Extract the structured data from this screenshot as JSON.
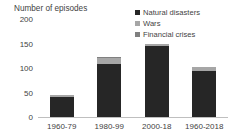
{
  "chart_data": {
    "type": "bar",
    "stacked": true,
    "title": "Number of episodes",
    "xlabel": "",
    "ylabel": "Number of episodes",
    "ylim": [
      0,
      200
    ],
    "yticks": [
      0,
      50,
      100,
      150,
      200
    ],
    "ytick_labels": [
      "0",
      "50",
      "100",
      "150",
      "200"
    ],
    "grid": false,
    "legend_position": "top-right",
    "categories": [
      "1960-79",
      "1980-99",
      "2000-18",
      "1960-2018"
    ],
    "series": [
      {
        "name": "Natural disasters",
        "color": "#262626",
        "values": [
          43,
          110,
          146,
          96
        ]
      },
      {
        "name": "Wars",
        "color": "#a6a6a6",
        "values": [
          3,
          12,
          5,
          8
        ]
      },
      {
        "name": "Financial crises",
        "color": "#808080",
        "values": [
          1,
          2,
          1,
          1
        ]
      }
    ],
    "totals": [
      47,
      124,
      152,
      105
    ]
  },
  "legend": {
    "items": [
      {
        "label": "Natural disasters",
        "color": "#262626",
        "marker": "square-marker"
      },
      {
        "label": "Wars",
        "color": "#a6a6a6",
        "marker": "square-marker"
      },
      {
        "label": "Financial crises",
        "color": "#808080",
        "marker": "square-marker"
      }
    ]
  },
  "axis": {
    "title": "Number of episodes",
    "baseline_color": "#bfbfbf"
  }
}
